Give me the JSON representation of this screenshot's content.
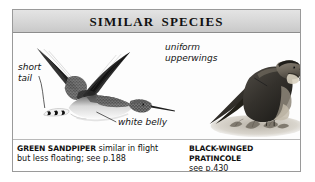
{
  "panel": {
    "title": "SIMILAR SPECIES",
    "border_color": "#9a9a9a",
    "header_bg": "#d6d6d6",
    "page_bg": "#ffffff"
  },
  "annotations": [
    {
      "id": "short-tail",
      "text": "short\ntail",
      "style": "italic",
      "points_to": "green-sandpiper-tail"
    },
    {
      "id": "white-belly",
      "text": "white belly",
      "style": "italic",
      "points_to": "green-sandpiper-belly"
    },
    {
      "id": "uniform-upperwings",
      "text": "uniform\nupperwings",
      "style": "italic",
      "points_to": "pratincole-upperwing"
    }
  ],
  "illustrations": [
    {
      "id": "green-sandpiper",
      "subject": "Green Sandpiper in flight",
      "pose": "flying, wings raised",
      "plumage": "blackish upperwings, white belly, dark barred short tail, long straight bill"
    },
    {
      "id": "black-winged-pratincole",
      "subject": "Black-winged Pratincole perched",
      "pose": "standing on ground",
      "plumage": "dark blackish-brown upperparts, paler buff throat and head, long wings crossed over tail"
    }
  ],
  "captions": {
    "left": {
      "species": "GREEN SANDPIPER",
      "line1_rest": " similar in flight",
      "line2": "but less floating; see p.188"
    },
    "right": {
      "species": "BLACK-WINGED PRATINCOLE",
      "line1_rest": "",
      "line2": "see p.430"
    }
  }
}
